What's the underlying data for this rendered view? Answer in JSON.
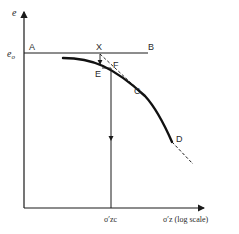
{
  "diagram": {
    "type": "e-log-sigma consolidation curve (Casagrande construction)",
    "y_axis": {
      "label": "e",
      "arrow": true
    },
    "x_axis": {
      "label": "σ′z (log scale)",
      "arrow": true
    },
    "eo_label": "eo",
    "points": {
      "A": "A",
      "B": "B",
      "X": "X",
      "E": "E",
      "F": "F",
      "C": "C",
      "D": "D"
    },
    "sigma_zc_label": "σ′zc",
    "colors": {
      "ink": "#1a1a1a",
      "background": "#ffffff"
    }
  }
}
